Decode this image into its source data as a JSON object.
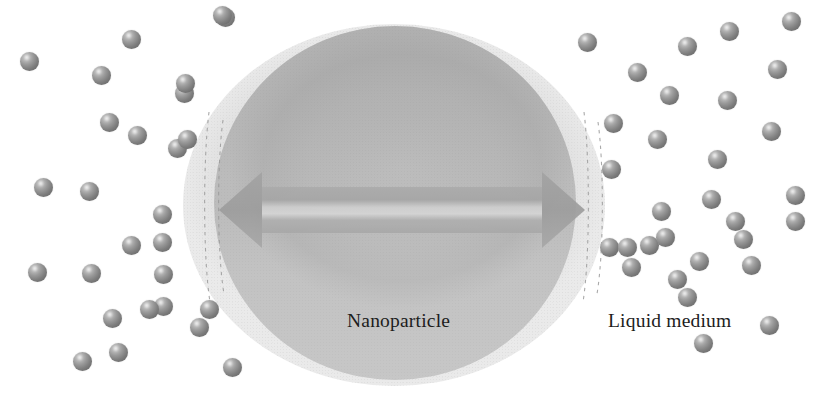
{
  "figure": {
    "background_color": "#ffffff",
    "width": 821,
    "height": 395
  },
  "labels": {
    "nanoparticle": "Nanoparticle",
    "liquid_medium": "Liquid medium"
  },
  "colors": {
    "sphere_highlight": "#d8d8d8",
    "sphere_mid": "#9a9a9a",
    "sphere_shadow": "#6e6e6e",
    "nanoparticle_core": "#b8b8b8",
    "nanoparticle_shell": "#e7e7e7",
    "arrow_fill": "#a9a9a9",
    "label_text": "#1d1d1d",
    "dashed_line": "#9b9b9b"
  },
  "nanoparticle": {
    "name": "nanoparticle",
    "shell": {
      "cx": 394,
      "cy": 205,
      "rx": 211,
      "ry": 181
    },
    "core": {
      "cx": 395,
      "cy": 203,
      "rx": 181,
      "ry": 177
    },
    "diameter_arrow": {
      "name": "diameter-arrow",
      "double_headed": true,
      "x1": 219,
      "x2": 584,
      "y": 210,
      "shaft_thickness": 46,
      "head_length": 40,
      "head_half_height": 40
    },
    "dashed_boundaries": [
      {
        "name": "left-inner-dashed",
        "x": 209,
        "y_top": 110,
        "y_bottom": 300
      },
      {
        "name": "left-outer-dashed",
        "x": 222,
        "y_top": 118,
        "y_bottom": 292
      },
      {
        "name": "right-inner-dashed",
        "x": 583,
        "y_top": 112,
        "y_bottom": 300
      },
      {
        "name": "right-outer-dashed",
        "x": 597,
        "y_top": 122,
        "y_bottom": 292
      }
    ]
  },
  "liquid_medium": {
    "name": "liquid-medium-molecules",
    "sphere_diameter": 19,
    "count": 58,
    "spheres": [
      {
        "x": 216,
        "y": 8,
        "d": 19
      },
      {
        "x": 122,
        "y": 30,
        "d": 19
      },
      {
        "x": 20,
        "y": 52,
        "d": 19
      },
      {
        "x": 92,
        "y": 66,
        "d": 19
      },
      {
        "x": 175,
        "y": 84,
        "d": 19
      },
      {
        "x": 100,
        "y": 113,
        "d": 19
      },
      {
        "x": 128,
        "y": 126,
        "d": 19
      },
      {
        "x": 168,
        "y": 139,
        "d": 19
      },
      {
        "x": 34,
        "y": 178,
        "d": 19
      },
      {
        "x": 80,
        "y": 182,
        "d": 19
      },
      {
        "x": 153,
        "y": 205,
        "d": 19
      },
      {
        "x": 153,
        "y": 233,
        "d": 19
      },
      {
        "x": 122,
        "y": 236,
        "d": 19
      },
      {
        "x": 28,
        "y": 263,
        "d": 19
      },
      {
        "x": 82,
        "y": 264,
        "d": 19
      },
      {
        "x": 154,
        "y": 265,
        "d": 19
      },
      {
        "x": 154,
        "y": 297,
        "d": 19
      },
      {
        "x": 103,
        "y": 309,
        "d": 19
      },
      {
        "x": 190,
        "y": 318,
        "d": 19
      },
      {
        "x": 109,
        "y": 343,
        "d": 19
      },
      {
        "x": 73,
        "y": 352,
        "d": 19
      },
      {
        "x": 223,
        "y": 358,
        "d": 19
      },
      {
        "x": 178,
        "y": 130,
        "d": 19
      },
      {
        "x": 213,
        "y": 6,
        "d": 19
      },
      {
        "x": 578,
        "y": 33,
        "d": 19
      },
      {
        "x": 628,
        "y": 63,
        "d": 19
      },
      {
        "x": 678,
        "y": 37,
        "d": 19
      },
      {
        "x": 720,
        "y": 22,
        "d": 19
      },
      {
        "x": 782,
        "y": 12,
        "d": 19
      },
      {
        "x": 718,
        "y": 91,
        "d": 19
      },
      {
        "x": 660,
        "y": 86,
        "d": 19
      },
      {
        "x": 762,
        "y": 122,
        "d": 19
      },
      {
        "x": 602,
        "y": 160,
        "d": 19
      },
      {
        "x": 648,
        "y": 130,
        "d": 19
      },
      {
        "x": 708,
        "y": 150,
        "d": 19
      },
      {
        "x": 652,
        "y": 202,
        "d": 19
      },
      {
        "x": 726,
        "y": 212,
        "d": 19
      },
      {
        "x": 786,
        "y": 186,
        "d": 19
      },
      {
        "x": 690,
        "y": 252,
        "d": 19
      },
      {
        "x": 622,
        "y": 258,
        "d": 19
      },
      {
        "x": 742,
        "y": 256,
        "d": 19
      },
      {
        "x": 786,
        "y": 212,
        "d": 19
      },
      {
        "x": 734,
        "y": 230,
        "d": 19
      },
      {
        "x": 640,
        "y": 236,
        "d": 19
      },
      {
        "x": 678,
        "y": 288,
        "d": 19
      },
      {
        "x": 694,
        "y": 334,
        "d": 19
      },
      {
        "x": 760,
        "y": 316,
        "d": 19
      },
      {
        "x": 822,
        "y": 260,
        "d": 19
      },
      {
        "x": 668,
        "y": 270,
        "d": 19
      },
      {
        "x": 600,
        "y": 238,
        "d": 19
      },
      {
        "x": 656,
        "y": 228,
        "d": 19
      },
      {
        "x": 702,
        "y": 190,
        "d": 19
      },
      {
        "x": 768,
        "y": 60,
        "d": 19
      },
      {
        "x": 604,
        "y": 114,
        "d": 19
      },
      {
        "x": 618,
        "y": 238,
        "d": 19
      },
      {
        "x": 176,
        "y": 74,
        "d": 19
      },
      {
        "x": 140,
        "y": 300,
        "d": 19
      },
      {
        "x": 200,
        "y": 300,
        "d": 19
      }
    ]
  }
}
